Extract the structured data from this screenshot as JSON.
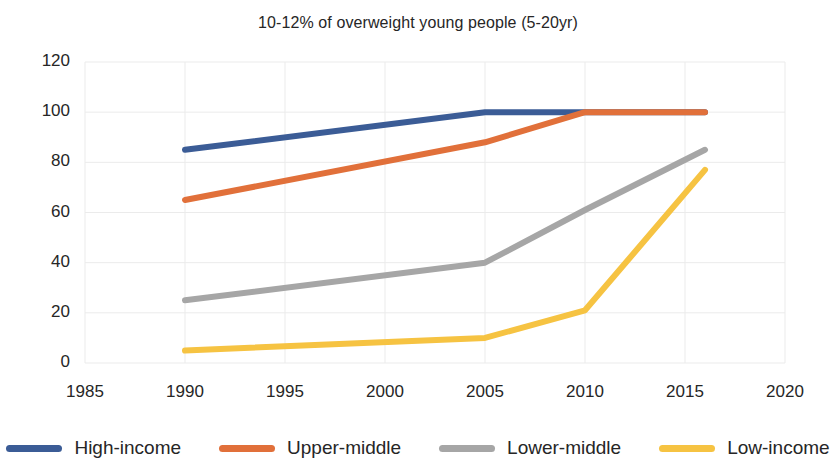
{
  "chart_data": {
    "type": "line",
    "title": "10-12% of overweight young people (5-20yr)",
    "xlabel": "",
    "ylabel": "",
    "xlim": [
      1985,
      2020
    ],
    "ylim": [
      0,
      120
    ],
    "xticks": [
      1985,
      1990,
      1995,
      2000,
      2005,
      2010,
      2015,
      2020
    ],
    "yticks": [
      0,
      20,
      40,
      60,
      80,
      100,
      120
    ],
    "grid": true,
    "legend_position": "bottom",
    "series": [
      {
        "name": "High-income",
        "color": "#3B5C96",
        "x": [
          1990,
          2005,
          2010,
          2016
        ],
        "values": [
          85,
          100,
          100,
          100
        ]
      },
      {
        "name": "Upper-middle",
        "color": "#E1703A",
        "x": [
          1990,
          2005,
          2010,
          2016
        ],
        "values": [
          65,
          88,
          100,
          100
        ]
      },
      {
        "name": "Lower-middle",
        "color": "#A6A6A6",
        "x": [
          1990,
          2005,
          2010,
          2016
        ],
        "values": [
          25,
          40,
          61,
          85
        ]
      },
      {
        "name": "Low-income",
        "color": "#F6C342",
        "x": [
          1990,
          2005,
          2010,
          2016
        ],
        "values": [
          5,
          10,
          21,
          77
        ]
      }
    ]
  },
  "legend": {
    "items": [
      {
        "label": "High-income",
        "color": "#3B5C96"
      },
      {
        "label": "Upper-middle",
        "color": "#E1703A"
      },
      {
        "label": "Lower-middle",
        "color": "#A6A6A6"
      },
      {
        "label": "Low-income",
        "color": "#F6C342"
      }
    ]
  },
  "axes": {
    "y_labels": [
      "120",
      "100",
      "80",
      "60",
      "40",
      "20",
      "0"
    ],
    "x_labels": [
      "1985",
      "1990",
      "1995",
      "2000",
      "2005",
      "2010",
      "2015",
      "2020"
    ]
  }
}
